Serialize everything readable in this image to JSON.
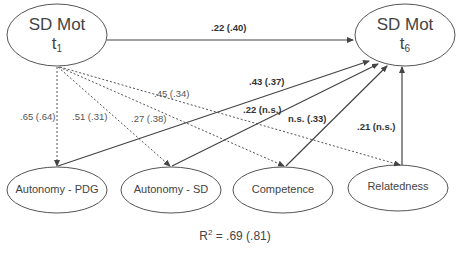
{
  "diagram": {
    "nodes": {
      "t1": {
        "title": "SD Mot",
        "sub_base": "t",
        "sub_index": "1"
      },
      "t6": {
        "title": "SD Mot",
        "sub_base": "t",
        "sub_index": "6"
      },
      "autonomy_pdg": {
        "label": "Autonomy - PDG"
      },
      "autonomy_sd": {
        "label": "Autonomy - SD"
      },
      "competence": {
        "label": "Competence"
      },
      "relatedness": {
        "label": "Relatedness"
      }
    },
    "edges": {
      "t1_t6": ".22 (.40)",
      "t1_pdg": ".65 (.64)",
      "t1_sd": ".51 (.31)",
      "t1_comp": ".27 (.38)",
      "t1_rel": ".45 (.34)",
      "pdg_t6": ".43 (.37)",
      "sd_t6": ".22 (n.s.)",
      "comp_t6": "n.s. (.33)",
      "rel_t6": ".21 (n.s.)"
    },
    "r2": {
      "label": "R",
      "exp": "2",
      "value": " = .69 (.81)"
    },
    "colors": {
      "line": "#444444",
      "text": "#444444",
      "background": "#ffffff"
    }
  }
}
